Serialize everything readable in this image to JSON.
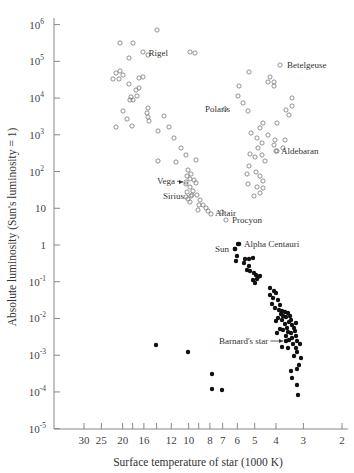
{
  "chart_data": {
    "type": "scatter",
    "title": "",
    "xlabel": "Surface temperature of star (1000 K)",
    "ylabel": "Absolute luminosity (Sun's luminosity = 1)",
    "x_scale": "log-reversed",
    "y_scale": "log",
    "xlim": [
      30,
      2
    ],
    "ylim": [
      1e-05,
      1000000
    ],
    "x_ticks": [
      {
        "value": 30,
        "label": "30"
      },
      {
        "value": 25,
        "label": "25"
      },
      {
        "value": 20,
        "label": "20"
      },
      {
        "value": 18,
        "label": ""
      },
      {
        "value": 16,
        "label": "16"
      },
      {
        "value": 14,
        "label": ""
      },
      {
        "value": 12,
        "label": "12"
      },
      {
        "value": 10,
        "label": "10"
      },
      {
        "value": 9,
        "label": ""
      },
      {
        "value": 8,
        "label": "8"
      },
      {
        "value": 7,
        "label": "7"
      },
      {
        "value": 6,
        "label": "6"
      },
      {
        "value": 5,
        "label": "5"
      },
      {
        "value": 4,
        "label": "4"
      },
      {
        "value": 3,
        "label": "3"
      },
      {
        "value": 2,
        "label": "2"
      }
    ],
    "y_ticks": [
      {
        "exp": 6,
        "base": "10",
        "sup": "6"
      },
      {
        "exp": 5,
        "base": "10",
        "sup": "5"
      },
      {
        "exp": 4,
        "base": "10",
        "sup": "4"
      },
      {
        "exp": 3,
        "base": "10",
        "sup": "3"
      },
      {
        "exp": 2,
        "base": "10",
        "sup": "2"
      },
      {
        "exp": 1,
        "base": "10",
        "sup": ""
      },
      {
        "exp": 0,
        "base": "1",
        "sup": ""
      },
      {
        "exp": -1,
        "base": "10",
        "sup": "-1"
      },
      {
        "exp": -2,
        "base": "10",
        "sup": "-2"
      },
      {
        "exp": -3,
        "base": "10",
        "sup": "-3"
      },
      {
        "exp": -4,
        "base": "10",
        "sup": "-4"
      },
      {
        "exp": -5,
        "base": "10",
        "sup": "-5"
      }
    ],
    "grid": false,
    "legend": null,
    "series": [
      {
        "name": "Giants, supergiants & upper main sequence (open circles)",
        "marker": "open-circle",
        "points_px": [
          [
            120,
            43
          ],
          [
            133,
            43
          ],
          [
            129,
            58
          ],
          [
            148,
            55
          ],
          [
            143,
            52
          ],
          [
            157,
            30
          ],
          [
            116,
            73
          ],
          [
            120,
            71
          ],
          [
            123,
            75
          ],
          [
            113,
            79
          ],
          [
            119,
            79
          ],
          [
            129,
            84
          ],
          [
            139,
            78
          ],
          [
            143,
            77
          ],
          [
            139,
            88
          ],
          [
            136,
            90
          ],
          [
            131,
            97
          ],
          [
            133,
            100
          ],
          [
            130,
            100
          ],
          [
            123,
            111
          ],
          [
            137,
            96
          ],
          [
            116,
            127
          ],
          [
            127,
            119
          ],
          [
            148,
            108
          ],
          [
            147,
            113
          ],
          [
            148,
            117
          ],
          [
            149,
            121
          ],
          [
            164,
            116
          ],
          [
            132,
            126
          ],
          [
            158,
            131
          ],
          [
            169,
            127
          ],
          [
            174,
            138
          ],
          [
            181,
            148
          ],
          [
            186,
            155
          ],
          [
            196,
            160
          ],
          [
            158,
            161
          ],
          [
            176,
            162
          ],
          [
            188,
            170
          ],
          [
            191,
            174
          ],
          [
            187,
            176
          ],
          [
            190,
            179
          ],
          [
            194,
            180
          ],
          [
            196,
            183
          ],
          [
            186,
            184
          ],
          [
            190,
            187
          ],
          [
            193,
            191
          ],
          [
            187,
            192
          ],
          [
            192,
            195
          ],
          [
            186,
            197
          ],
          [
            197,
            195
          ],
          [
            188,
            199
          ],
          [
            190,
            202
          ],
          [
            200,
            200
          ],
          [
            203,
            205
          ],
          [
            206,
            208
          ],
          [
            198,
            210
          ],
          [
            208,
            211
          ],
          [
            222,
            212
          ],
          [
            199,
            205
          ],
          [
            243,
            103
          ],
          [
            239,
            86
          ],
          [
            249,
            72
          ],
          [
            270,
            77
          ],
          [
            268,
            82
          ],
          [
            274,
            82
          ],
          [
            274,
            86
          ],
          [
            238,
            96
          ],
          [
            248,
            111
          ],
          [
            263,
            123
          ],
          [
            260,
            128
          ],
          [
            251,
            133
          ],
          [
            257,
            138
          ],
          [
            262,
            143
          ],
          [
            275,
            140
          ],
          [
            274,
            145
          ],
          [
            277,
            151
          ],
          [
            289,
            115
          ],
          [
            286,
            110
          ],
          [
            292,
            98
          ],
          [
            292,
            106
          ],
          [
            250,
            154
          ],
          [
            255,
            157
          ],
          [
            262,
            155
          ],
          [
            249,
            166
          ],
          [
            256,
            172
          ],
          [
            260,
            176
          ],
          [
            263,
            181
          ],
          [
            257,
            187
          ],
          [
            263,
            188
          ],
          [
            260,
            193
          ],
          [
            254,
            196
          ],
          [
            277,
            123
          ],
          [
            247,
            174
          ],
          [
            258,
            148
          ],
          [
            268,
            135
          ],
          [
            265,
            161
          ],
          [
            248,
            184
          ],
          [
            285,
            140
          ],
          [
            283,
            148
          ]
        ]
      },
      {
        "name": "Main sequence lower & red dwarfs (filled dots)",
        "marker": "filled-dot",
        "points_px": [
          [
            238,
            244
          ],
          [
            235,
            249
          ],
          [
            237,
            256
          ],
          [
            236,
            261
          ],
          [
            245,
            259
          ],
          [
            249,
            259
          ],
          [
            253,
            258
          ],
          [
            244,
            263
          ],
          [
            249,
            266
          ],
          [
            247,
            270
          ],
          [
            250,
            271
          ],
          [
            256,
            275
          ],
          [
            258,
            277
          ],
          [
            253,
            280
          ],
          [
            255,
            283
          ],
          [
            257,
            279
          ],
          [
            260,
            276
          ],
          [
            254,
            273
          ],
          [
            270,
            288
          ],
          [
            274,
            291
          ],
          [
            270,
            295
          ],
          [
            276,
            293
          ],
          [
            273,
            298
          ],
          [
            278,
            300
          ],
          [
            272,
            304
          ],
          [
            280,
            305
          ],
          [
            275,
            308
          ],
          [
            279,
            310
          ],
          [
            282,
            311
          ],
          [
            285,
            312
          ],
          [
            281,
            314
          ],
          [
            288,
            313
          ],
          [
            283,
            316
          ],
          [
            286,
            317
          ],
          [
            290,
            316
          ],
          [
            291,
            320
          ],
          [
            289,
            322
          ],
          [
            285,
            324
          ],
          [
            282,
            320
          ],
          [
            278,
            318
          ],
          [
            276,
            321
          ],
          [
            292,
            325
          ],
          [
            294,
            328
          ],
          [
            296,
            323
          ],
          [
            287,
            328
          ],
          [
            283,
            330
          ],
          [
            288,
            332
          ],
          [
            291,
            333
          ],
          [
            295,
            331
          ],
          [
            286,
            336
          ],
          [
            292,
            338
          ],
          [
            296,
            336
          ],
          [
            289,
            340
          ],
          [
            297,
            341
          ],
          [
            280,
            329
          ],
          [
            277,
            333
          ],
          [
            293,
            344
          ],
          [
            282,
            347
          ],
          [
            288,
            348
          ],
          [
            300,
            344
          ],
          [
            297,
            352
          ],
          [
            301,
            358
          ],
          [
            299,
            365
          ],
          [
            297,
            369
          ],
          [
            291,
            371
          ],
          [
            292,
            378
          ],
          [
            297,
            385
          ],
          [
            298,
            395
          ],
          [
            296,
            348
          ],
          [
            294,
            356
          ]
        ]
      },
      {
        "name": "White dwarfs (filled dots)",
        "marker": "filled-dot",
        "points_px": [
          [
            156,
            345
          ],
          [
            188,
            352
          ],
          [
            212,
            374
          ],
          [
            212,
            389
          ],
          [
            222,
            390
          ]
        ]
      }
    ],
    "annotations": [
      {
        "label": "Rigel",
        "marker_px": [
          190,
          52
        ],
        "text_px": [
          168,
          56
        ],
        "anchor": "end",
        "marker": "open-circle"
      },
      {
        "label": "Betelgeuse",
        "marker_px": [
          280,
          65
        ],
        "text_px": [
          287,
          68
        ],
        "anchor": "start",
        "marker": "open-circle"
      },
      {
        "label": "Polaris",
        "marker_px": [
          225,
          109
        ],
        "text_px": [
          205,
          112
        ],
        "anchor": "start",
        "marker": "open-circle"
      },
      {
        "label": "Aldebaran",
        "marker_px": [
          276,
          151
        ],
        "text_px": [
          281,
          154
        ],
        "anchor": "start",
        "marker": "open-circle"
      },
      {
        "label": "Vega",
        "marker_px": [
          186,
          182
        ],
        "text_px": [
          157,
          184
        ],
        "anchor": "start",
        "marker": "open-circle",
        "arrow": true
      },
      {
        "label": "Sirius",
        "marker_px": [
          191,
          196
        ],
        "text_px": [
          163,
          199
        ],
        "anchor": "start",
        "marker": "open-circle"
      },
      {
        "label": "Altair",
        "marker_px": [
          211,
          214
        ],
        "text_px": [
          215,
          216
        ],
        "anchor": "start",
        "marker": "open-circle"
      },
      {
        "label": "Procyon",
        "marker_px": [
          226,
          220
        ],
        "text_px": [
          232,
          223
        ],
        "anchor": "start",
        "marker": "open-circle"
      },
      {
        "label": "Alpha Centauri",
        "marker_px": [
          239,
          244
        ],
        "text_px": [
          244,
          247
        ],
        "anchor": "start",
        "marker": "filled-dot"
      },
      {
        "label": "Sun",
        "marker_px": [
          235,
          249
        ],
        "text_px": [
          215,
          252
        ],
        "anchor": "start",
        "marker": "filled-dot"
      },
      {
        "label": "Barnard's star",
        "marker_px": [
          286,
          341
        ],
        "text_px": [
          219,
          344
        ],
        "anchor": "start",
        "marker": "filled-dot",
        "arrow": true
      }
    ]
  }
}
